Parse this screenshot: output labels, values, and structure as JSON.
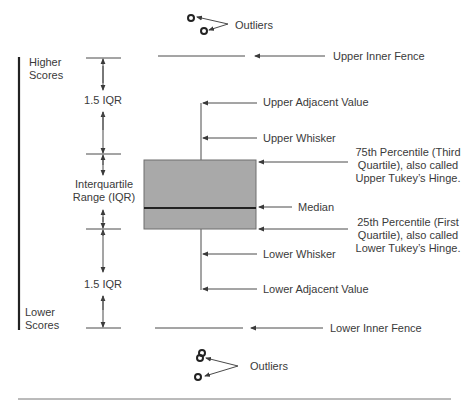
{
  "diagram": {
    "type": "box-plot-anatomy",
    "colors": {
      "line": "#4a4a4a",
      "box_fill": "#a9a9a9",
      "box_border": "#6f6f6f",
      "median": "#222222",
      "scale_bar": "#222222",
      "text": "#3a3a3a"
    },
    "scale": {
      "top_label_line1": "Higher",
      "top_label_line2": "Scores",
      "bottom_label_line1": "Lower",
      "bottom_label_line2": "Scores"
    },
    "intervals": {
      "upper": "1.5 IQR",
      "middle_line1": "Interquartile",
      "middle_line2": "Range (IQR)",
      "lower": "1.5 IQR"
    },
    "annotations": {
      "outliers_top": "Outliers",
      "upper_inner_fence": "Upper Inner Fence",
      "upper_adjacent_value": "Upper Adjacent Value",
      "upper_whisker": "Upper Whisker",
      "q3_line1": "75th Percentile (Third",
      "q3_line2": "Quartile), also called",
      "q3_line3": "Upper Tukey’s Hinge.",
      "median": "Median",
      "q1_line1": "25th Percentile (First",
      "q1_line2": "Quartile), also called",
      "q1_line3": "Lower Tukey’s Hinge.",
      "lower_whisker": "Lower Whisker",
      "lower_adjacent_value": "Lower Adjacent Value",
      "lower_inner_fence": "Lower Inner Fence",
      "outliers_bottom": "Outliers"
    }
  }
}
